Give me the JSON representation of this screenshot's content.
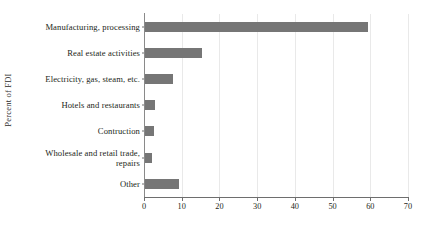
{
  "chart_data": {
    "type": "bar",
    "orientation": "horizontal",
    "title": "",
    "xlabel": "",
    "ylabel": "Percent of FDI",
    "xlim": [
      0,
      70
    ],
    "xticks": [
      0,
      10,
      20,
      30,
      40,
      50,
      60,
      70
    ],
    "grid": true,
    "legend": null,
    "bar_color": "#767676",
    "categories": [
      "Manufacturing, processing",
      "Real estate activities",
      "Electricity, gas, steam, etc.",
      "Hotels and restaurants",
      "Contruction",
      "Wholesale and retail trade, repairs",
      "Other"
    ],
    "category_lines": [
      [
        "Manufacturing, processing"
      ],
      [
        "Real estate activities"
      ],
      [
        "Electricity, gas, steam, etc."
      ],
      [
        "Hotels and restaurants"
      ],
      [
        "Contruction"
      ],
      [
        "Wholesale and retail trade,",
        "repairs"
      ],
      [
        "Other"
      ]
    ],
    "values": [
      59.5,
      15.4,
      7.7,
      2.9,
      2.7,
      2.2,
      9.3
    ]
  }
}
